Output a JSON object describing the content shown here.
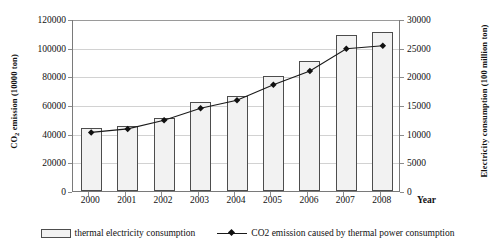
{
  "chart_data": {
    "type": "bar",
    "title": "",
    "xlabel": "Year",
    "ylabel": "CO2 emission (10000 ton)",
    "y2label": "Electricity consumption (100 million ton)",
    "categories": [
      "2000",
      "2001",
      "2002",
      "2003",
      "2004",
      "2005",
      "2006",
      "2007",
      "2008"
    ],
    "ylim": [
      0,
      120000
    ],
    "y2lim": [
      0,
      30000
    ],
    "yticks": [
      "0",
      "20000",
      "40000",
      "60000",
      "80000",
      "100000",
      "120000"
    ],
    "y2ticks": [
      "0",
      "5000",
      "10000",
      "15000",
      "20000",
      "25000",
      "30000"
    ],
    "grid": true,
    "legend_position": "bottom",
    "series": [
      {
        "name": "thermal electricity consumption",
        "type": "bar",
        "axis": "left",
        "values": [
          44000,
          45500,
          51000,
          62000,
          66500,
          80500,
          91000,
          109000,
          111000
        ]
      },
      {
        "name": "CO2 emission caused by thermal power consumption",
        "type": "line",
        "axis": "right",
        "values": [
          10400,
          11000,
          12500,
          14600,
          16000,
          18700,
          21100,
          25000,
          25500
        ]
      }
    ]
  },
  "axes": {
    "y_left_title_pre": "CO",
    "y_left_title_sub": "2",
    "y_left_title_post": " emission (10000 ton)",
    "y_right_title": "Electricity consumption (100 million ton)",
    "x_title": "Year"
  },
  "legend": {
    "bar_label": "thermal electricity consumption",
    "line_label": "CO2 emission caused by thermal power consumption"
  },
  "colors": {
    "bar_fill": "#f2f2f2",
    "bar_border": "#4d4d4d",
    "line": "#1a1a1a",
    "marker": "#111111",
    "grid": "#d2d2d2",
    "axis": "#7a7a7a",
    "text": "#1a1a1a"
  }
}
